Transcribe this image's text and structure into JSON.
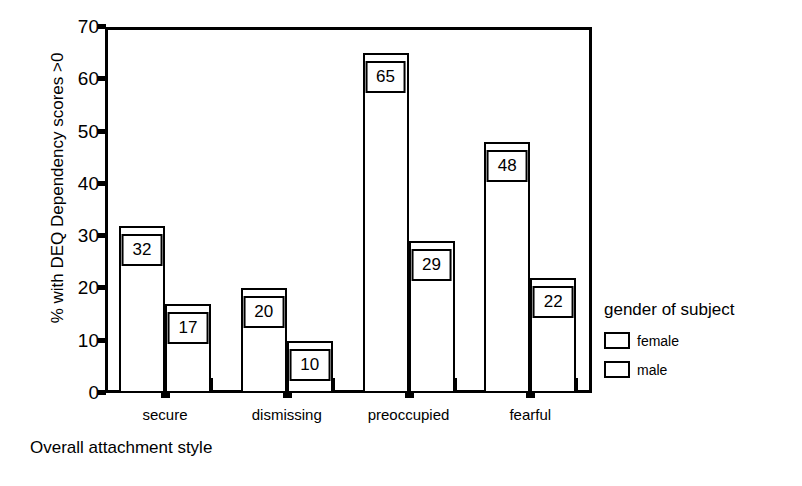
{
  "chart_data": {
    "type": "bar",
    "title": "",
    "subtitle": "",
    "xlabel": "Overall attachment style",
    "ylabel": "% with DEQ Dependency scores >0",
    "categories": [
      "secure",
      "dismissing",
      "preoccupied",
      "fearful"
    ],
    "series": [
      {
        "name": "female",
        "values": [
          32,
          20,
          65,
          48
        ]
      },
      {
        "name": "male",
        "values": [
          17,
          10,
          29,
          22
        ]
      }
    ],
    "ylim": [
      0,
      70
    ],
    "ytick_labels": [
      "0",
      "10",
      "20",
      "30",
      "40",
      "50",
      "60",
      "70"
    ],
    "ytick_values": [
      0,
      10,
      20,
      30,
      40,
      50,
      60,
      70
    ],
    "grid": false,
    "legend_position": "right",
    "legend_title": "gender of subject",
    "bar_fill_color": "#ffffff",
    "bar_border_color": "#000000",
    "data_labels_shown": true
  },
  "legend": {
    "title": "gender of subject",
    "entries": [
      {
        "label": "female"
      },
      {
        "label": "male"
      }
    ]
  },
  "axes": {
    "y_title": "% with DEQ Dependency scores >0",
    "x_title": "Overall attachment style"
  }
}
